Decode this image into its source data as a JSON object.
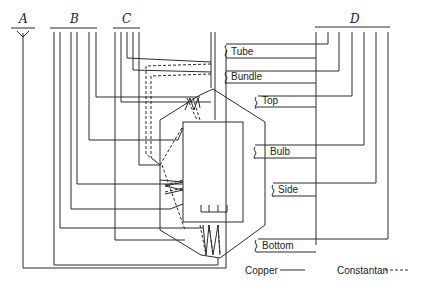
{
  "diagram": {
    "type": "thermocouple wiring diagram",
    "terminal_groups": [
      {
        "id": "A",
        "label": "A"
      },
      {
        "id": "B",
        "label": "B"
      },
      {
        "id": "C",
        "label": "C"
      },
      {
        "id": "D",
        "label": "D"
      }
    ],
    "junction_labels": [
      {
        "id": "tube",
        "label": "Tube"
      },
      {
        "id": "bundle",
        "label": "Bundle"
      },
      {
        "id": "top",
        "label": "Top"
      },
      {
        "id": "bulb",
        "label": "Bulb"
      },
      {
        "id": "side",
        "label": "Side"
      },
      {
        "id": "bottom",
        "label": "Bottom"
      }
    ],
    "legend": {
      "copper": "Copper",
      "constantan": "Constantan"
    }
  }
}
